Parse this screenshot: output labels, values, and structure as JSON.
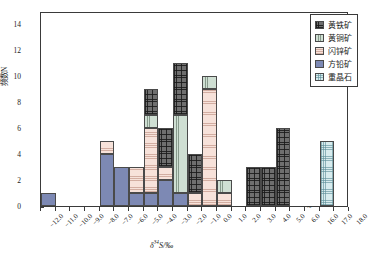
{
  "chart_data": {
    "type": "bar",
    "title": "",
    "xlabel": "δ³⁴S/‰",
    "ylabel": "频数N",
    "ylim": [
      0,
      15
    ],
    "yticks": [
      0,
      2,
      4,
      6,
      8,
      10,
      12,
      14
    ],
    "xticklabels": [
      "-12.0",
      "-11.0",
      "-10.0",
      "-9.0",
      "-8.0",
      "-7.0",
      "-6.0",
      "-5.0",
      "-4.0",
      "-3.0",
      "-2.0",
      "-1.0",
      "0.0",
      "1.0",
      "2.0",
      "3.0",
      "4.0",
      "5.0",
      "6.0",
      "16.0",
      "17.0",
      "18.0"
    ],
    "grid": false,
    "legend_position": "top-right",
    "axis_break": "~",
    "stacked": true,
    "bin_width": 1.0,
    "series": [
      {
        "name": "黄铁矿",
        "pattern": "dark-crosshatch",
        "color": "#6f6f6f"
      },
      {
        "name": "黄铜矿",
        "pattern": "green-vertical",
        "color": "#cfdfd3"
      },
      {
        "name": "闪锌矿",
        "pattern": "pink-horizontal",
        "color": "#f7e2da"
      },
      {
        "name": "方铅矿",
        "pattern": "solid-blue",
        "color": "#7d89b4"
      },
      {
        "name": "重晶石",
        "pattern": "cyan-crosshatch",
        "color": "#d8ecee"
      }
    ],
    "bins": [
      {
        "x0": "-12.0",
        "x1": "-11.0",
        "total": 1,
        "stack": [
          {
            "series": "方铅矿",
            "value": 1
          }
        ]
      },
      {
        "x0": "-8.0",
        "x1": "-7.0",
        "total": 5,
        "stack": [
          {
            "series": "方铅矿",
            "value": 4
          },
          {
            "series": "闪锌矿",
            "value": 1
          }
        ]
      },
      {
        "x0": "-7.0",
        "x1": "-6.0",
        "total": 3,
        "stack": [
          {
            "series": "方铅矿",
            "value": 3
          }
        ]
      },
      {
        "x0": "-6.0",
        "x1": "-5.0",
        "total": 3,
        "stack": [
          {
            "series": "方铅矿",
            "value": 1
          },
          {
            "series": "闪锌矿",
            "value": 2
          }
        ]
      },
      {
        "x0": "-5.0",
        "x1": "-4.0",
        "total": 9,
        "stack": [
          {
            "series": "方铅矿",
            "value": 1
          },
          {
            "series": "闪锌矿",
            "value": 5
          },
          {
            "series": "黄铜矿",
            "value": 1
          },
          {
            "series": "黄铁矿",
            "value": 2
          }
        ]
      },
      {
        "x0": "-4.0",
        "x1": "-3.0",
        "total": 6,
        "stack": [
          {
            "series": "方铅矿",
            "value": 2
          },
          {
            "series": "闪锌矿",
            "value": 1
          },
          {
            "series": "黄铁矿",
            "value": 3
          }
        ]
      },
      {
        "x0": "-3.0",
        "x1": "-2.0",
        "total": 11,
        "stack": [
          {
            "series": "方铅矿",
            "value": 1
          },
          {
            "series": "黄铜矿",
            "value": 6
          },
          {
            "series": "黄铁矿",
            "value": 4
          }
        ]
      },
      {
        "x0": "-2.0",
        "x1": "-1.0",
        "total": 4,
        "stack": [
          {
            "series": "闪锌矿",
            "value": 1
          },
          {
            "series": "黄铁矿",
            "value": 3
          }
        ]
      },
      {
        "x0": "-1.0",
        "x1": "0.0",
        "total": 10,
        "stack": [
          {
            "series": "闪锌矿",
            "value": 9
          },
          {
            "series": "黄铜矿",
            "value": 1
          }
        ]
      },
      {
        "x0": "0.0",
        "x1": "1.0",
        "total": 2,
        "stack": [
          {
            "series": "闪锌矿",
            "value": 1
          },
          {
            "series": "黄铜矿",
            "value": 1
          }
        ]
      },
      {
        "x0": "2.0",
        "x1": "3.0",
        "total": 3,
        "stack": [
          {
            "series": "黄铁矿",
            "value": 3
          }
        ]
      },
      {
        "x0": "3.0",
        "x1": "4.0",
        "total": 3,
        "stack": [
          {
            "series": "黄铁矿",
            "value": 3
          }
        ]
      },
      {
        "x0": "4.0",
        "x1": "5.0",
        "total": 6,
        "stack": [
          {
            "series": "黄铁矿",
            "value": 6
          }
        ]
      },
      {
        "x0": "16.0",
        "x1": "17.0",
        "total": 5,
        "stack": [
          {
            "series": "重晶石",
            "value": 5
          }
        ]
      }
    ]
  },
  "legend": {
    "items": [
      {
        "label": "黄铁矿",
        "cls": "p-pyrite",
        "name": "legend-item-pyrite"
      },
      {
        "label": "黄铜矿",
        "cls": "p-chalco",
        "name": "legend-item-chalcopyrite"
      },
      {
        "label": "闪锌矿",
        "cls": "p-sphal",
        "name": "legend-item-sphalerite"
      },
      {
        "label": "方铅矿",
        "cls": "p-galena",
        "name": "legend-item-galena"
      },
      {
        "label": "重晶石",
        "cls": "p-barite",
        "name": "legend-item-barite"
      }
    ]
  },
  "axes": {
    "x_label": "δ³⁴S/‰",
    "y_label": "频数N",
    "break_marker": "~"
  }
}
